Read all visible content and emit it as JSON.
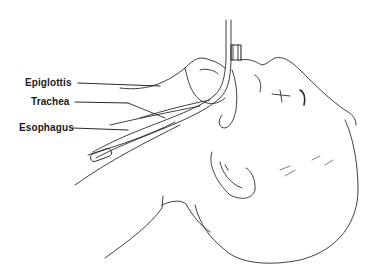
{
  "diagram": {
    "labels": [
      {
        "text": "Epiglottis"
      },
      {
        "text": "Trachea"
      },
      {
        "text": "Esophagus"
      }
    ],
    "line_color": "#2a2a2a"
  }
}
